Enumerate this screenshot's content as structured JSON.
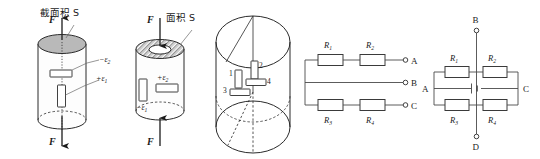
{
  "figure": {
    "background_color": "#ffffff",
    "line_color": "#2b2b2b",
    "solid_fill_color": "#b9b9b9",
    "panel_count": 5
  },
  "panels": {
    "tension_cylinder": {
      "name": "solid-cylinder-tension",
      "area_label": "截面积 S",
      "force_top_label": "F",
      "force_bottom_label": "F",
      "gauges": [
        {
          "id": "transverse",
          "label_sign": "−",
          "label_symbol": "ε",
          "label_subscript": "2",
          "orientation": "horizontal"
        },
        {
          "id": "axial",
          "label_sign": "+",
          "label_symbol": "ε",
          "label_subscript": "1",
          "orientation": "vertical"
        }
      ]
    },
    "compression_tube": {
      "name": "hollow-tube-compression",
      "area_label": "面积 S",
      "force_top_label": "F",
      "force_bottom_label": "F",
      "gauges": [
        {
          "id": "transverse",
          "label_sign": "+",
          "label_symbol": "ε",
          "label_subscript": "2",
          "orientation": "horizontal"
        },
        {
          "id": "axial",
          "label_sign": "−",
          "label_symbol": "ε",
          "label_subscript": "1",
          "orientation": "vertical"
        }
      ]
    },
    "torsion_cylinder": {
      "name": "cylinder-four-gauges",
      "gauge_numbers": [
        "1",
        "2",
        "3",
        "4"
      ]
    },
    "series_network": {
      "name": "three-terminal-resistor-network",
      "resistors": [
        {
          "symbol": "R",
          "subscript": "1",
          "row": "top"
        },
        {
          "symbol": "R",
          "subscript": "2",
          "row": "top"
        },
        {
          "symbol": "R",
          "subscript": "3",
          "row": "bottom"
        },
        {
          "symbol": "R",
          "subscript": "4",
          "row": "bottom"
        }
      ],
      "terminals": [
        "A",
        "B",
        "C"
      ]
    },
    "bridge_network": {
      "name": "wheatstone-bridge",
      "resistors": [
        {
          "symbol": "R",
          "subscript": "1",
          "position": "top-left"
        },
        {
          "symbol": "R",
          "subscript": "2",
          "position": "top-right"
        },
        {
          "symbol": "R",
          "subscript": "3",
          "position": "bottom-left"
        },
        {
          "symbol": "R",
          "subscript": "4",
          "position": "bottom-right"
        }
      ],
      "terminals": [
        "A",
        "B",
        "C",
        "D"
      ],
      "source": "battery-cell"
    }
  }
}
